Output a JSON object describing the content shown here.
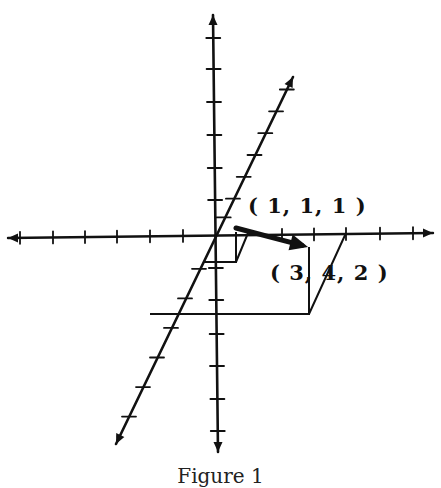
{
  "figure": {
    "caption": "Figure 1",
    "ink_color": "#111111",
    "background": "#ffffff",
    "origin": [
      216,
      233
    ],
    "axes": {
      "horizontal": {
        "from": [
          8,
          238
        ],
        "to": [
          433,
          233
        ],
        "ticks_x": [
          20,
          53,
          85,
          117,
          150,
          183,
          282,
          314,
          346,
          380,
          413
        ]
      },
      "vertical": {
        "from": [
          218,
          452
        ],
        "to": [
          213,
          15
        ],
        "ticks_y": [
          38,
          69,
          102,
          135,
          168,
          200,
          268,
          300,
          334,
          366,
          399,
          431
        ]
      },
      "oblique": {
        "from": [
          116,
          444
        ],
        "to": [
          293,
          77
        ],
        "ticks_t": [
          -0.87,
          -0.73,
          -0.59,
          -0.45,
          -0.31,
          -0.17,
          0.1,
          0.22,
          0.36,
          0.5,
          0.64,
          0.78,
          0.92
        ]
      }
    },
    "small_box": [
      [
        203,
        262
      ],
      [
        236,
        262
      ],
      [
        236,
        232
      ],
      [
        236,
        262
      ],
      [
        248,
        233
      ]
    ],
    "vector_arrow": {
      "from": [
        236,
        228
      ],
      "to": [
        308,
        247
      ]
    },
    "large_box": [
      [
        150,
        314
      ],
      [
        309,
        314
      ],
      [
        309,
        247
      ],
      [
        309,
        314
      ],
      [
        346,
        233
      ]
    ],
    "labels": [
      {
        "id": "point-1-1-1",
        "text": "( 1, 1, 1 )",
        "x": 248,
        "y": 195
      },
      {
        "id": "point-3-4-2",
        "text": "( 3, 4, 2 )",
        "x": 270,
        "y": 262
      }
    ]
  }
}
